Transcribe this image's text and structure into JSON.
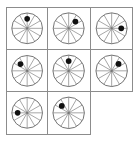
{
  "figure": {
    "rows": 3,
    "columns": 3,
    "background_color": "#ffffff",
    "grid_line_color": "#8c8c8c",
    "circle_stroke_color": "#555555",
    "spoke_stroke_color": "#777777",
    "dot_color": "#111111",
    "spoke_count": 6,
    "sector_count": 12
  },
  "cells": [
    {
      "id": "cell-r1c1",
      "row": 1,
      "column": 1,
      "position_label": "top-left",
      "has_wheel": true,
      "dot_present": true,
      "dot_clock_position": "12 o'clock",
      "dot_angle_degrees": 0,
      "dot_radius_fraction": 0.62
    },
    {
      "id": "cell-r1c2",
      "row": 1,
      "column": 2,
      "position_label": "top-center",
      "has_wheel": true,
      "dot_present": true,
      "dot_clock_position": "1:30",
      "dot_angle_degrees": 45,
      "dot_radius_fraction": 0.62
    },
    {
      "id": "cell-r1c3",
      "row": 1,
      "column": 3,
      "position_label": "top-right",
      "has_wheel": true,
      "dot_present": true,
      "dot_clock_position": "3 o'clock",
      "dot_angle_degrees": 90,
      "dot_radius_fraction": 0.62
    },
    {
      "id": "cell-r2c1",
      "row": 2,
      "column": 1,
      "position_label": "middle-left",
      "has_wheel": true,
      "dot_present": true,
      "dot_clock_position": "10:30",
      "dot_angle_degrees": 315,
      "dot_radius_fraction": 0.62
    },
    {
      "id": "cell-r2c2",
      "row": 2,
      "column": 2,
      "position_label": "middle-center",
      "has_wheel": true,
      "dot_present": true,
      "dot_clock_position": "12 o'clock",
      "dot_angle_degrees": 0,
      "dot_radius_fraction": 0.62
    },
    {
      "id": "cell-r2c3",
      "row": 2,
      "column": 3,
      "position_label": "middle-right",
      "has_wheel": true,
      "dot_present": true,
      "dot_clock_position": "1:30",
      "dot_angle_degrees": 45,
      "dot_radius_fraction": 0.62
    },
    {
      "id": "cell-r3c1",
      "row": 3,
      "column": 1,
      "position_label": "bottom-left",
      "has_wheel": true,
      "dot_present": true,
      "dot_clock_position": "9 o'clock",
      "dot_angle_degrees": 270,
      "dot_radius_fraction": 0.62
    },
    {
      "id": "cell-r3c2",
      "row": 3,
      "column": 2,
      "position_label": "bottom-center",
      "has_wheel": true,
      "dot_present": true,
      "dot_clock_position": "10:30",
      "dot_angle_degrees": 315,
      "dot_radius_fraction": 0.62
    },
    {
      "id": "cell-r3c3",
      "row": 3,
      "column": 3,
      "position_label": "bottom-right",
      "has_wheel": false,
      "dot_present": false,
      "dot_clock_position": "",
      "dot_angle_degrees": null,
      "dot_radius_fraction": null
    }
  ]
}
